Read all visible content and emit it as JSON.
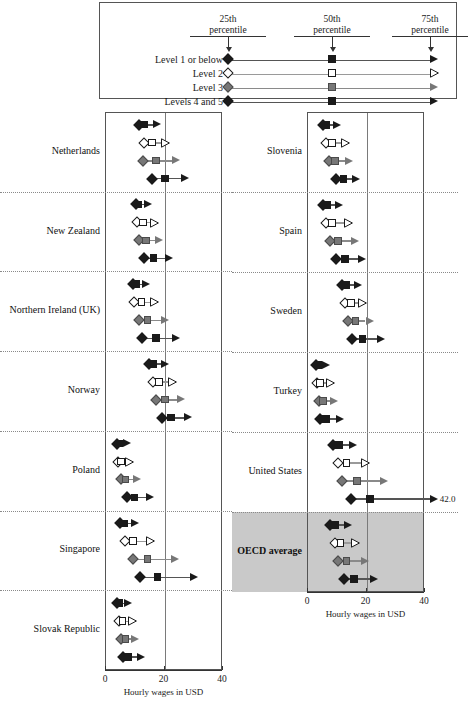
{
  "legend": {
    "headers": [
      {
        "line1": "25th",
        "line2": "percentile"
      },
      {
        "line1": "50th",
        "line2": "percentile"
      },
      {
        "line1": "75th",
        "line2": "percentile"
      }
    ],
    "rows": [
      {
        "label": "Level 1 or below",
        "style": "filled-black"
      },
      {
        "label": "Level 2",
        "style": "hollow-white"
      },
      {
        "label": "Level 3",
        "style": "filled-gray"
      },
      {
        "label": "Levels 4 and 5",
        "style": "filled-black"
      }
    ]
  },
  "axis": {
    "ticks": [
      "0",
      "20",
      "40"
    ],
    "tick_values": [
      0,
      20,
      40
    ],
    "title": "Hourly wages in USD",
    "min": 0,
    "max": 40
  },
  "colors": {
    "black": "#1a1a1a",
    "gray": "#777777",
    "white": "#ffffff",
    "line_dark": "#555555",
    "line_gray": "#8a8a8a",
    "highlight_band": "#c9c9c9"
  },
  "chart_data": {
    "type": "range",
    "title": "",
    "xlabel": "Hourly wages in USD",
    "ylabel": "",
    "xlim": [
      0,
      40
    ],
    "grid": true,
    "legend_position": "top",
    "series": [
      {
        "name": "Level 1 or below",
        "style": "filled-black"
      },
      {
        "name": "Level 2",
        "style": "hollow-white"
      },
      {
        "name": "Level 3",
        "style": "filled-gray"
      },
      {
        "name": "Levels 4 and 5",
        "style": "filled-black"
      }
    ],
    "percentiles": [
      "25th percentile",
      "50th percentile",
      "75th percentile"
    ],
    "panels": [
      {
        "side": "left",
        "countries": [
          {
            "name": "Netherlands",
            "highlight": false,
            "rows": [
              {
                "series": "Level 1 or below",
                "p25": 11.5,
                "p50": 13.5,
                "p75": 16.5
              },
              {
                "series": "Level 2",
                "p25": 13.5,
                "p50": 16.0,
                "p75": 19.0
              },
              {
                "series": "Level 3",
                "p25": 13.0,
                "p50": 17.5,
                "p75": 23.0
              },
              {
                "series": "Levels 4 and 5",
                "p25": 16.0,
                "p50": 20.5,
                "p75": 26.0
              }
            ]
          },
          {
            "name": "New Zealand",
            "highlight": false,
            "rows": [
              {
                "series": "Level 1 or below",
                "p25": 10.5,
                "p50": 11.5,
                "p75": 13.5
              },
              {
                "series": "Level 2",
                "p25": 11.0,
                "p50": 13.0,
                "p75": 15.5
              },
              {
                "series": "Level 3",
                "p25": 11.5,
                "p50": 14.0,
                "p75": 17.0
              },
              {
                "series": "Levels 4 and 5",
                "p25": 13.5,
                "p50": 16.5,
                "p75": 20.5
              }
            ]
          },
          {
            "name": "Northern Ireland (UK)",
            "highlight": false,
            "rows": [
              {
                "series": "Level 1 or below",
                "p25": 9.5,
                "p50": 10.5,
                "p75": 12.5
              },
              {
                "series": "Level 2",
                "p25": 10.0,
                "p50": 12.5,
                "p75": 15.5
              },
              {
                "series": "Level 3",
                "p25": 11.5,
                "p50": 14.5,
                "p75": 19.0
              },
              {
                "series": "Levels 4 and 5",
                "p25": 12.5,
                "p50": 17.5,
                "p75": 23.0
              }
            ]
          },
          {
            "name": "Norway",
            "highlight": false,
            "rows": [
              {
                "series": "Level 1 or below",
                "p25": 15.0,
                "p50": 16.5,
                "p75": 19.0
              },
              {
                "series": "Level 2",
                "p25": 16.5,
                "p50": 18.5,
                "p75": 21.5
              },
              {
                "series": "Level 3",
                "p25": 17.5,
                "p50": 20.5,
                "p75": 24.5
              },
              {
                "series": "Levels 4 and 5",
                "p25": 19.5,
                "p50": 22.5,
                "p75": 27.0
              }
            ]
          },
          {
            "name": "Poland",
            "highlight": false,
            "rows": [
              {
                "series": "Level 1 or below",
                "p25": 4.0,
                "p50": 4.8,
                "p75": 6.0
              },
              {
                "series": "Level 2",
                "p25": 4.5,
                "p50": 5.5,
                "p75": 7.0
              },
              {
                "series": "Level 3",
                "p25": 5.5,
                "p50": 7.0,
                "p75": 9.5
              },
              {
                "series": "Levels 4 and 5",
                "p25": 7.5,
                "p50": 10.0,
                "p75": 14.0
              }
            ]
          },
          {
            "name": "Singapore",
            "highlight": false,
            "rows": [
              {
                "series": "Level 1 or below",
                "p25": 5.0,
                "p50": 6.5,
                "p75": 9.0
              },
              {
                "series": "Level 2",
                "p25": 7.0,
                "p50": 9.5,
                "p75": 14.0
              },
              {
                "series": "Level 3",
                "p25": 9.5,
                "p50": 14.5,
                "p75": 22.5
              },
              {
                "series": "Levels 4 and 5",
                "p25": 12.0,
                "p50": 18.0,
                "p75": 29.0
              }
            ]
          },
          {
            "name": "Slovak Republic",
            "highlight": false,
            "rows": [
              {
                "series": "Level 1 or below",
                "p25": 4.0,
                "p50": 5.0,
                "p75": 6.5
              },
              {
                "series": "Level 2",
                "p25": 4.8,
                "p50": 6.0,
                "p75": 7.8
              },
              {
                "series": "Level 3",
                "p25": 5.5,
                "p50": 7.0,
                "p75": 9.0
              },
              {
                "series": "Levels 4 and 5",
                "p25": 6.0,
                "p50": 8.0,
                "p75": 11.0
              }
            ]
          }
        ]
      },
      {
        "side": "right",
        "countries": [
          {
            "name": "Slovenia",
            "highlight": false,
            "rows": [
              {
                "series": "Level 1 or below",
                "p25": 5.5,
                "p50": 6.5,
                "p75": 9.0
              },
              {
                "series": "Level 2",
                "p25": 6.5,
                "p50": 8.5,
                "p75": 11.5
              },
              {
                "series": "Level 3",
                "p25": 7.5,
                "p50": 9.5,
                "p75": 13.0
              },
              {
                "series": "Levels 4 and 5",
                "p25": 10.0,
                "p50": 12.5,
                "p75": 15.5
              }
            ]
          },
          {
            "name": "Spain",
            "highlight": false,
            "rows": [
              {
                "series": "Level 1 or below",
                "p25": 5.5,
                "p50": 7.0,
                "p75": 9.5
              },
              {
                "series": "Level 2",
                "p25": 6.5,
                "p50": 8.5,
                "p75": 12.5
              },
              {
                "series": "Level 3",
                "p25": 8.0,
                "p50": 10.5,
                "p75": 15.0
              },
              {
                "series": "Levels 4 and 5",
                "p25": 10.0,
                "p50": 13.0,
                "p75": 17.5
              }
            ]
          },
          {
            "name": "Sweden",
            "highlight": false,
            "rows": [
              {
                "series": "Level 1 or below",
                "p25": 12.0,
                "p50": 13.5,
                "p75": 16.0
              },
              {
                "series": "Level 2",
                "p25": 13.0,
                "p50": 15.0,
                "p75": 17.5
              },
              {
                "series": "Level 3",
                "p25": 14.0,
                "p50": 16.5,
                "p75": 20.0
              },
              {
                "series": "Levels 4 and 5",
                "p25": 15.5,
                "p50": 19.0,
                "p75": 24.0
              }
            ]
          },
          {
            "name": "Turkey",
            "highlight": false,
            "rows": [
              {
                "series": "Level 1 or below",
                "p25": 3.0,
                "p50": 3.8,
                "p75": 5.0
              },
              {
                "series": "Level 2",
                "p25": 3.5,
                "p50": 4.5,
                "p75": 6.5
              },
              {
                "series": "Level 3",
                "p25": 4.0,
                "p50": 5.5,
                "p75": 8.0
              },
              {
                "series": "Levels 4 and 5",
                "p25": 4.5,
                "p50": 6.5,
                "p75": 10.0
              }
            ]
          },
          {
            "name": "United States",
            "highlight": false,
            "rows": [
              {
                "series": "Level 1 or below",
                "p25": 9.0,
                "p50": 11.0,
                "p75": 14.5
              },
              {
                "series": "Level 2",
                "p25": 10.5,
                "p50": 13.5,
                "p75": 18.5
              },
              {
                "series": "Level 3",
                "p25": 12.0,
                "p50": 17.0,
                "p75": 25.0
              },
              {
                "series": "Levels 4 and 5",
                "p25": 15.0,
                "p50": 21.5,
                "p75": 42.0,
                "annotation": "42.0",
                "clipped": true
              }
            ]
          },
          {
            "name": "OECD average",
            "highlight": true,
            "rows": [
              {
                "series": "Level 1 or below",
                "p25": 8.0,
                "p50": 9.5,
                "p75": 12.5
              },
              {
                "series": "Level 2",
                "p25": 9.5,
                "p50": 11.5,
                "p75": 15.0
              },
              {
                "series": "Level 3",
                "p25": 10.5,
                "p50": 13.5,
                "p75": 18.5
              },
              {
                "series": "Levels 4 and 5",
                "p25": 12.5,
                "p50": 16.0,
                "p75": 21.5
              }
            ]
          }
        ]
      }
    ]
  }
}
